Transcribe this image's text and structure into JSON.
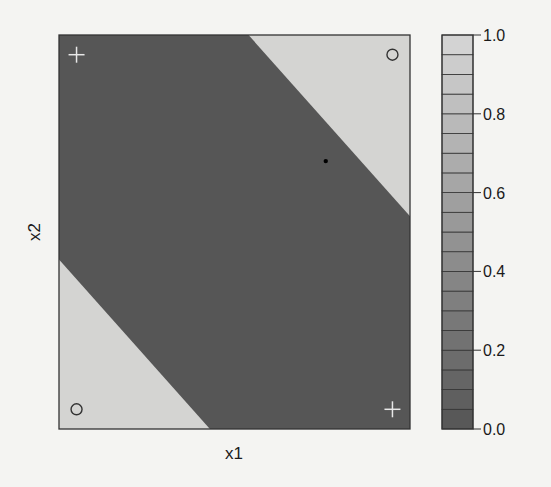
{
  "chart_data": {
    "type": "heatmap",
    "title": "",
    "xlabel": "x1",
    "ylabel": "x2",
    "xlim": [
      0,
      1
    ],
    "ylim": [
      0,
      1
    ],
    "grid": false,
    "regions": [
      {
        "name": "upper-right light region",
        "value": 1.0,
        "polygon": [
          [
            0.54,
            1.0
          ],
          [
            1.0,
            1.0
          ],
          [
            1.0,
            0.54
          ]
        ]
      },
      {
        "name": "lower-left light region",
        "value": 1.0,
        "polygon": [
          [
            0.0,
            0.0
          ],
          [
            0.43,
            0.0
          ],
          [
            0.0,
            0.43
          ]
        ]
      },
      {
        "name": "diagonal dark band",
        "value": 0.0
      }
    ],
    "points": [
      {
        "x1": 0.05,
        "x2": 0.95,
        "marker": "+",
        "color": "#e8e8e8"
      },
      {
        "x1": 0.95,
        "x2": 0.95,
        "marker": "o",
        "color": "#333333"
      },
      {
        "x1": 0.05,
        "x2": 0.05,
        "marker": "o",
        "color": "#333333"
      },
      {
        "x1": 0.95,
        "x2": 0.05,
        "marker": "+",
        "color": "#e8e8e8"
      },
      {
        "x1": 0.76,
        "x2": 0.68,
        "marker": "dot",
        "color": "#000000"
      }
    ],
    "colorbar": {
      "min": 0.0,
      "max": 1.0,
      "segments": 20,
      "ticks": [
        0.0,
        0.2,
        0.4,
        0.6,
        0.8,
        1.0
      ],
      "tick_labels": [
        "0.0",
        "0.2",
        "0.4",
        "0.6",
        "0.8",
        "1.0"
      ],
      "color_low": "#555555",
      "color_high": "#d6d6d6"
    },
    "colors": {
      "light": "#d4d4d2",
      "dark": "#565656",
      "frame": "#333333",
      "background": "#f4f4f2"
    }
  }
}
